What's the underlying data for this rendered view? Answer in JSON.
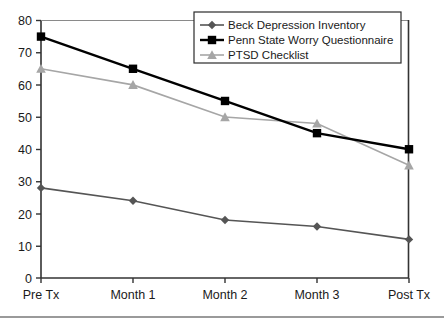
{
  "chart_data": {
    "type": "line",
    "title": "",
    "xlabel": "",
    "ylabel": "",
    "categories": [
      "Pre Tx",
      "Month 1",
      "Month 2",
      "Month 3",
      "Post Tx"
    ],
    "ylim": [
      0,
      80
    ],
    "yticks": [
      0,
      10,
      20,
      30,
      40,
      50,
      60,
      70,
      80
    ],
    "grid": false,
    "legend_position": "top-right",
    "series": [
      {
        "name": "Beck Depression Inventory",
        "marker": "diamond",
        "color": "#555555",
        "values": [
          28,
          24,
          18,
          16,
          12
        ]
      },
      {
        "name": "Penn State Worry Questionnaire",
        "marker": "square",
        "color": "#000000",
        "values": [
          75,
          65,
          55,
          45,
          40
        ]
      },
      {
        "name": "PTSD Checklist",
        "marker": "triangle",
        "color": "#a6a6a6",
        "values": [
          65,
          60,
          50,
          48,
          35
        ]
      }
    ]
  },
  "axis": {
    "y_labels": [
      "80",
      "70",
      "60",
      "50",
      "40",
      "30",
      "20",
      "10",
      "0"
    ],
    "x_labels": [
      "Pre Tx",
      "Month 1",
      "Month 2",
      "Month 3",
      "Post Tx"
    ]
  },
  "legend": {
    "items": [
      {
        "label": "Beck Depression Inventory",
        "marker_name": "diamond-marker"
      },
      {
        "label": "Penn State Worry Questionnaire",
        "marker_name": "square-marker"
      },
      {
        "label": "PTSD Checklist",
        "marker_name": "triangle-marker"
      }
    ]
  }
}
